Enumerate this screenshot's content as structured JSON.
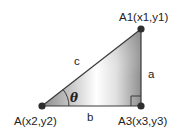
{
  "diagram": {
    "type": "right-triangle",
    "points": [
      {
        "id": "A",
        "label": "A(x2,y2)",
        "x": 42,
        "y": 106
      },
      {
        "id": "A1",
        "label": "A1(x1,y1)",
        "x": 141,
        "y": 29
      },
      {
        "id": "A3",
        "label": "A3(x3,y3)",
        "x": 141,
        "y": 106
      }
    ],
    "sides": {
      "a": "a",
      "b": "b",
      "c": "c"
    },
    "angle_label": "θ",
    "colors": {
      "line": "#3a3a3a",
      "point": "#2e2e2e",
      "fill_dark": "#8c8c8c",
      "fill_light": "#ffffff"
    }
  }
}
